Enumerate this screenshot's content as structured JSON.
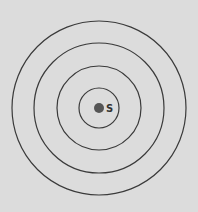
{
  "diagram": {
    "source_label": "S",
    "wavefront_count": 4,
    "colors": {
      "background": "#dcdcdc",
      "lines": "#3a3a3a",
      "source": "#555555"
    }
  }
}
